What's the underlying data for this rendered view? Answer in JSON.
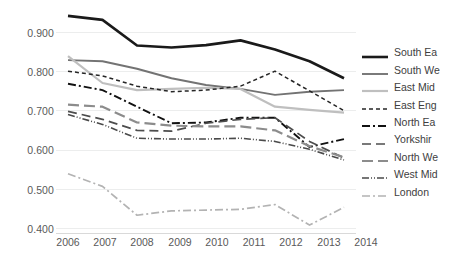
{
  "chart_data": {
    "type": "line",
    "title": "",
    "xlabel": "",
    "ylabel": "",
    "categories": [
      2006,
      2007,
      2008,
      2009,
      2010,
      2011,
      2012,
      2013,
      2014
    ],
    "x_tick_labels": [
      "2006",
      "2007",
      "2008",
      "2009",
      "2010",
      "2011",
      "2012",
      "2013",
      "2014"
    ],
    "y_tick_labels": [
      "0.900",
      "0.800",
      "0.700",
      "0.600",
      "0.500",
      "0.400"
    ],
    "y_ticks": [
      0.9,
      0.8,
      0.7,
      0.6,
      0.5,
      0.4
    ],
    "ylim": [
      0.38,
      0.95
    ],
    "grid": "horizontal",
    "legend_position": "right",
    "series": [
      {
        "name": "South Ea",
        "values": [
          0.93,
          0.92,
          0.855,
          0.85,
          0.856,
          0.868,
          0.845,
          0.815,
          0.772
        ],
        "color": "#1a1a1a",
        "width": 2.6,
        "dash": "none"
      },
      {
        "name": "South We",
        "values": [
          0.818,
          0.815,
          0.796,
          0.772,
          0.755,
          0.745,
          0.73,
          0.738,
          0.742
        ],
        "color": "#737373",
        "width": 1.9,
        "dash": "none"
      },
      {
        "name": "East Mid",
        "values": [
          0.828,
          0.76,
          0.742,
          0.745,
          0.748,
          0.745,
          0.7,
          0.692,
          0.685
        ],
        "color": "#bfbfbf",
        "width": 2.2,
        "dash": "none"
      },
      {
        "name": "East Eng",
        "values": [
          0.79,
          0.778,
          0.752,
          0.738,
          0.742,
          0.752,
          0.79,
          0.74,
          0.69
        ],
        "color": "#262626",
        "width": 1.5,
        "dash": "4,3"
      },
      {
        "name": "North Ea",
        "values": [
          0.758,
          0.742,
          0.7,
          0.658,
          0.66,
          0.672,
          0.672,
          0.598,
          0.618
        ],
        "color": "#111111",
        "width": 1.9,
        "dash": "8,3,2,3"
      },
      {
        "name": "Yorkshir",
        "values": [
          0.688,
          0.668,
          0.64,
          0.638,
          0.658,
          0.668,
          0.672,
          0.612,
          0.57
        ],
        "color": "#4d4d4d",
        "width": 1.7,
        "dash": "9,5"
      },
      {
        "name": "North We",
        "values": [
          0.705,
          0.7,
          0.66,
          0.652,
          0.65,
          0.65,
          0.64,
          0.6,
          0.572
        ],
        "color": "#8c8c8c",
        "width": 2.2,
        "dash": "11,5"
      },
      {
        "name": "West Mid",
        "values": [
          0.68,
          0.655,
          0.62,
          0.618,
          0.618,
          0.62,
          0.612,
          0.592,
          0.565
        ],
        "color": "#4a4a4a",
        "width": 1.6,
        "dash": "7,2,1,2,1,2"
      },
      {
        "name": "London",
        "values": [
          0.53,
          0.498,
          0.425,
          0.436,
          0.438,
          0.44,
          0.452,
          0.4,
          0.445
        ],
        "color": "#b3b3b3",
        "width": 1.7,
        "dash": "8,3,2,3"
      }
    ]
  }
}
